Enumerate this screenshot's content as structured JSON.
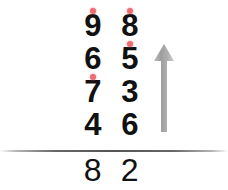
{
  "problem": {
    "type": "column-addition",
    "columns": [
      "tens",
      "ones"
    ],
    "addends": [
      {
        "tens": "9",
        "ones": "8",
        "carry_tens": true,
        "carry_ones": true
      },
      {
        "tens": "6",
        "ones": "5",
        "carry_tens": false,
        "carry_ones": true
      },
      {
        "tens": "7",
        "ones": "3",
        "carry_tens": true,
        "carry_ones": false
      },
      {
        "tens": "4",
        "ones": "6",
        "carry_tens": false,
        "carry_ones": false
      }
    ],
    "sum": {
      "tens": "8",
      "ones": "2"
    }
  },
  "arrow": {
    "icon": "arrow-up-icon",
    "direction": "up",
    "color": "#a8a8a8"
  },
  "colors": {
    "digit": "#111111",
    "carry_dot": "#ef6b72",
    "rule": "#555555",
    "background": "#ffffff"
  }
}
